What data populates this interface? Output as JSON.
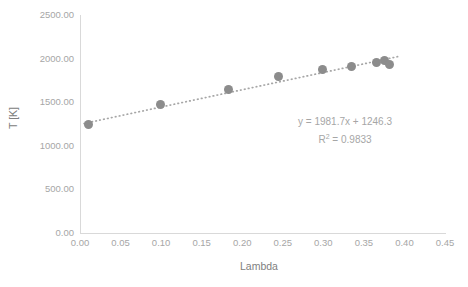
{
  "chart_data": {
    "type": "scatter",
    "title": "",
    "xlabel": "Lambda",
    "ylabel": "T [K]",
    "xlim": [
      0.0,
      0.45
    ],
    "ylim": [
      0.0,
      2500.0
    ],
    "xticks": [
      "0.00",
      "0.05",
      "0.10",
      "0.15",
      "0.20",
      "0.25",
      "0.30",
      "0.35",
      "0.40",
      "0.45"
    ],
    "xtick_values": [
      0.0,
      0.05,
      0.1,
      0.15,
      0.2,
      0.25,
      0.3,
      0.35,
      0.4,
      0.45
    ],
    "yticks": [
      "0.00",
      "500.00",
      "1000.00",
      "1500.00",
      "2000.00",
      "2500.00"
    ],
    "ytick_values": [
      0,
      500,
      1000,
      1500,
      2000,
      2500
    ],
    "grid": false,
    "legend": "none",
    "marker_color": "#8c8c8c",
    "trendline_color": "#a6a6a6",
    "axis_color": "#d9d9d9",
    "tick_label_color": "#a6a6a6",
    "axis_title_color": "#808080",
    "series": [
      {
        "name": "T [K] vs Lambda",
        "x": [
          0.011,
          0.099,
          0.183,
          0.245,
          0.299,
          0.335,
          0.366,
          0.376,
          0.382
        ],
        "y": [
          1250,
          1470,
          1640,
          1800,
          1880,
          1905,
          1960,
          1975,
          1930
        ]
      }
    ],
    "trendline": {
      "type": "linear",
      "slope": 1981.7,
      "intercept": 1246.3,
      "r_squared": 0.9833,
      "x_start": 0.005,
      "x_end": 0.395,
      "style": "dotted"
    },
    "annotations": {
      "equation": "y = 1981.7x + 1246.3",
      "r2_prefix": "R",
      "r2_exponent": "2",
      "r2_value": " = 0.9833"
    }
  }
}
